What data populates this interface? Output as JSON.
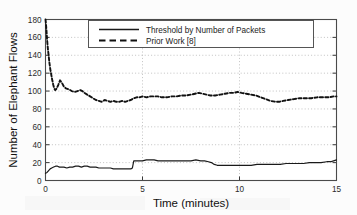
{
  "chart_data": {
    "type": "line",
    "title": "",
    "xlabel": "Time (minutes)",
    "ylabel": "Number of Elephant Flows",
    "xlim": [
      0,
      15
    ],
    "ylim": [
      0,
      180
    ],
    "xticks": [
      0,
      5,
      10,
      15
    ],
    "xtick_labels": [
      "0",
      "5",
      "10",
      "15"
    ],
    "yticks": [
      0,
      20,
      40,
      60,
      80,
      100,
      120,
      140,
      160,
      180
    ],
    "ytick_labels": [
      "0",
      "20",
      "40",
      "60",
      "80",
      "100",
      "120",
      "140",
      "160",
      "180"
    ],
    "grid": true,
    "grid_style": "dotted",
    "legend_position": "upper center",
    "legend_entries": [
      "Threshold by Number of Packets",
      "Prior Work [8]"
    ],
    "series": [
      {
        "name": "Threshold by Number of Packets",
        "style": "solid",
        "color": "#1a1a1a",
        "x": [
          0.0,
          0.08,
          0.16,
          0.24,
          0.32,
          0.42,
          0.52,
          0.62,
          0.72,
          0.82,
          0.95,
          1.1,
          1.25,
          1.4,
          1.55,
          1.7,
          1.85,
          2.0,
          2.15,
          2.3,
          2.45,
          2.6,
          2.75,
          2.9,
          3.05,
          3.2,
          3.35,
          3.5,
          3.65,
          3.8,
          3.95,
          4.1,
          4.25,
          4.4,
          4.48,
          4.55,
          4.7,
          4.85,
          5.0,
          5.2,
          5.4,
          5.6,
          5.8,
          6.0,
          6.25,
          6.5,
          6.75,
          7.0,
          7.25,
          7.5,
          7.75,
          8.0,
          8.2,
          8.4,
          8.55,
          8.7,
          8.85,
          9.0,
          9.25,
          9.5,
          9.75,
          10.0,
          10.3,
          10.6,
          10.9,
          11.2,
          11.5,
          11.8,
          12.1,
          12.4,
          12.7,
          13.0,
          13.3,
          13.6,
          13.9,
          14.2,
          14.5,
          14.7,
          14.85,
          15.0
        ],
        "y": [
          8,
          9,
          11,
          13,
          14,
          15,
          16,
          16,
          15,
          15,
          15,
          14,
          15,
          15,
          16,
          16,
          15,
          16,
          16,
          15,
          15,
          15,
          14,
          14,
          14,
          14,
          14,
          13,
          13,
          13,
          13,
          13,
          13,
          13,
          14,
          22,
          22,
          22,
          22,
          23,
          23,
          23,
          22,
          22,
          22,
          22,
          22,
          22,
          22,
          22,
          23,
          22,
          22,
          21,
          20,
          18,
          17,
          17,
          17,
          17,
          17,
          17,
          17,
          17,
          18,
          18,
          18,
          18,
          18,
          19,
          19,
          19,
          19,
          20,
          20,
          20,
          21,
          21,
          22,
          23
        ]
      },
      {
        "name": "Prior Work [8]",
        "style": "dashed",
        "color": "#111111",
        "x": [
          0.0,
          0.02,
          0.05,
          0.08,
          0.12,
          0.16,
          0.2,
          0.25,
          0.3,
          0.35,
          0.4,
          0.45,
          0.5,
          0.58,
          0.66,
          0.75,
          0.85,
          0.95,
          1.05,
          1.2,
          1.35,
          1.5,
          1.65,
          1.8,
          1.9,
          2.0,
          2.15,
          2.3,
          2.45,
          2.6,
          2.75,
          2.9,
          3.05,
          3.2,
          3.35,
          3.5,
          3.65,
          3.8,
          3.95,
          4.1,
          4.25,
          4.4,
          4.55,
          4.7,
          4.85,
          5.0,
          5.2,
          5.4,
          5.6,
          5.8,
          6.0,
          6.25,
          6.5,
          6.75,
          7.0,
          7.25,
          7.5,
          7.7,
          7.9,
          8.1,
          8.3,
          8.5,
          8.75,
          9.0,
          9.25,
          9.5,
          9.7,
          9.9,
          10.1,
          10.35,
          10.6,
          10.85,
          11.1,
          11.35,
          11.6,
          11.85,
          12.05,
          12.25,
          12.5,
          12.8,
          13.1,
          13.4,
          13.7,
          14.0,
          14.3,
          14.6,
          14.85,
          15.0
        ],
        "y": [
          180,
          176,
          168,
          158,
          148,
          140,
          132,
          124,
          118,
          112,
          107,
          103,
          101,
          103,
          107,
          112,
          109,
          105,
          103,
          102,
          100,
          99,
          100,
          101,
          100,
          98,
          96,
          94,
          92,
          90,
          89,
          88,
          90,
          89,
          88,
          89,
          88,
          88,
          89,
          88,
          89,
          90,
          92,
          93,
          93,
          94,
          93,
          94,
          94,
          94,
          93,
          93,
          94,
          94,
          95,
          95,
          96,
          97,
          98,
          97,
          96,
          95,
          95,
          96,
          97,
          98,
          98,
          99,
          98,
          97,
          96,
          95,
          93,
          91,
          89,
          88,
          88,
          89,
          90,
          91,
          92,
          92,
          92,
          93,
          93,
          93,
          94,
          94
        ]
      }
    ]
  },
  "legend": {
    "items": [
      {
        "label": "Threshold by Number of Packets",
        "style": "solid"
      },
      {
        "label": "Prior Work [8]",
        "style": "dashed"
      }
    ]
  },
  "axes": {
    "x_title": "Time (minutes)",
    "y_title": "Number of Elephant Flows"
  }
}
